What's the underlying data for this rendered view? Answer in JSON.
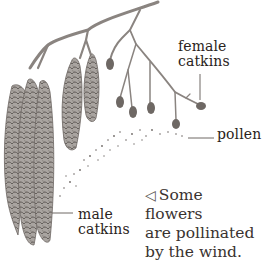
{
  "figure": {
    "labels": {
      "female": [
        "female",
        "catkins"
      ],
      "pollen": "pollen",
      "male": [
        "male",
        "catkins"
      ]
    },
    "caption": {
      "arrow_icon": "◁",
      "lines": [
        "Some flowers",
        "are pollinated",
        "by the wind."
      ]
    },
    "colors": {
      "stem": "#8a8480",
      "catkin": "#9a9490",
      "catkin_dark": "#5e5855",
      "pollen": "#6e6864",
      "text": "#2a2320"
    }
  }
}
